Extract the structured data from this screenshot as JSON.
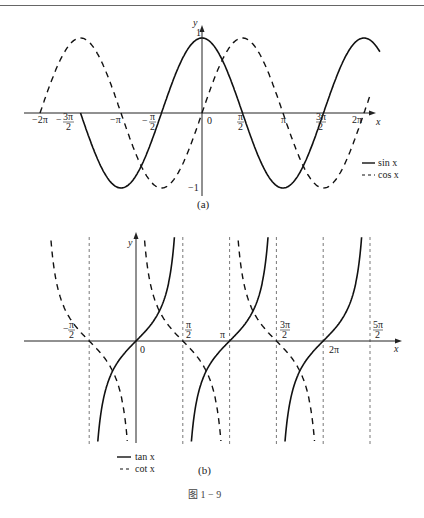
{
  "chart_data": [
    {
      "panel": "(a)",
      "type": "line",
      "title": "",
      "xlabel": "x",
      "ylabel": "y",
      "xlim": [
        -6.283,
        6.9
      ],
      "ylim": [
        -1,
        1
      ],
      "grid": false,
      "x_ticks": [
        "-2π",
        "-3π/2",
        "-π",
        "-π/2",
        "0",
        "π/2",
        "π",
        "3π/2",
        "2π"
      ],
      "y_ticks": [
        "1",
        "-1"
      ],
      "legend_position": "lower right",
      "series": [
        {
          "name": "sin x",
          "style": "solid",
          "function": "cos",
          "x_range": [
            -4.712,
            6.9
          ]
        },
        {
          "name": "cos x",
          "style": "dashed",
          "function": "sin",
          "x_range": [
            -6.283,
            6.5
          ]
        }
      ]
    },
    {
      "panel": "(b)",
      "type": "line",
      "title": "",
      "xlabel": "x",
      "ylabel": "y",
      "xlim": [
        -2.2,
        8.3
      ],
      "grid": false,
      "x_ticks": [
        "-π/2",
        "0",
        "π/2",
        "π",
        "3π/2",
        "2π",
        "5π/2"
      ],
      "asymptotes": [
        "-π/2",
        "π/2",
        "π",
        "3π/2",
        "2π",
        "5π/2"
      ],
      "legend_position": "lower left",
      "series": [
        {
          "name": "tan x",
          "style": "solid",
          "function": "tan",
          "branch_centers": [
            0,
            3.1416,
            6.2832
          ]
        },
        {
          "name": "cot x",
          "style": "dashed",
          "function": "cot",
          "branch_centers": [
            -1.5708,
            1.5708,
            4.7124
          ]
        }
      ]
    }
  ],
  "panel_a": {
    "y_axis_label": "y",
    "x_axis_label": "x",
    "tick_labels": {
      "neg_2pi": "−2π",
      "neg_3pi_2_num": "3π",
      "neg_3pi_2_den": "2",
      "neg_3pi_2_sign": "−",
      "neg_pi": "−π",
      "neg_pi_2_num": "π",
      "neg_pi_2_den": "2",
      "neg_pi_2_sign": "−",
      "zero": "0",
      "pi_2_num": "π",
      "pi_2_den": "2",
      "pi": "π",
      "three_pi_2_num": "3π",
      "three_pi_2_den": "2",
      "two_pi": "2π",
      "one": "1",
      "neg_one": "−1"
    },
    "legend": {
      "solid": "sin x",
      "dashed": "cos x"
    },
    "caption": "(a)"
  },
  "panel_b": {
    "y_axis_label": "y",
    "x_axis_label": "x",
    "tick_labels": {
      "neg_pi_2_sign": "−",
      "neg_pi_2_num": "π",
      "neg_pi_2_den": "2",
      "zero": "0",
      "pi_2_num": "π",
      "pi_2_den": "2",
      "pi": "π",
      "three_pi_2_num": "3π",
      "three_pi_2_den": "2",
      "two_pi": "2π",
      "five_pi_2_num": "5π",
      "five_pi_2_den": "2"
    },
    "legend": {
      "solid": "tan x",
      "dashed": "cot x"
    },
    "caption": "(b)"
  },
  "figure_caption": "图 1 − 9"
}
